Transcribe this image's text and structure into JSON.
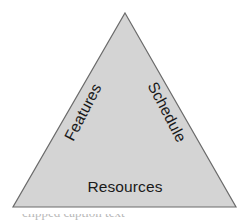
{
  "figure": {
    "name": "project-triangle",
    "background_color": "#ffffff",
    "shape": {
      "type": "triangle",
      "fill_color": "#d4d4d4",
      "stroke_color": "#6b6b6b",
      "stroke_width": 1.2,
      "apex": {
        "x": 125,
        "y": 13
      },
      "bottom_left": {
        "x": 13,
        "y": 207
      },
      "bottom_right": {
        "x": 236,
        "y": 207
      }
    },
    "labels": [
      {
        "id": "features",
        "text": "Features",
        "edge": "left",
        "rotation_deg": -62.5,
        "color": "#1a1a1a",
        "font_size": 15.5,
        "center": {
          "x": 83,
          "y": 112
        }
      },
      {
        "id": "schedule",
        "text": "Schedule",
        "edge": "right",
        "rotation_deg": 62.5,
        "color": "#1a1a1a",
        "font_size": 15.5,
        "center": {
          "x": 167,
          "y": 112
        }
      },
      {
        "id": "resources",
        "text": "Resources",
        "edge": "bottom",
        "rotation_deg": 0,
        "color": "#1a1a1a",
        "font_size": 15.5,
        "center": {
          "x": 125,
          "y": 187
        }
      }
    ],
    "caption_fragment": "clipped caption text"
  }
}
